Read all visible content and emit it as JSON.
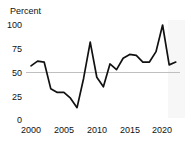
{
  "chart_data": {
    "type": "line",
    "title": "",
    "subtitle": "",
    "ylabel": "Percent",
    "xlabel": "",
    "ylim": [
      0,
      100
    ],
    "xlim": [
      1999,
      2022.5
    ],
    "yticks": [
      0,
      25,
      50,
      75,
      100
    ],
    "ytick_labels": [
      "0",
      "25",
      "50",
      "75",
      "100"
    ],
    "xticks": [
      2000,
      2005,
      2010,
      2015,
      2020
    ],
    "xtick_labels": [
      "2000",
      "2005",
      "2010",
      "2015",
      "2020"
    ],
    "grid": "horizontal-single-at-50",
    "reference_line": 50,
    "legend": "none",
    "line_color": "#111111",
    "gridline_color": "#bfbfbf",
    "background_color": "#ffffff",
    "x": [
      2000,
      2001,
      2002,
      2003,
      2004,
      2005,
      2006,
      2007,
      2008,
      2009,
      2010,
      2011,
      2012,
      2013,
      2014,
      2015,
      2016,
      2017,
      2018,
      2019,
      2020,
      2021,
      2022
    ],
    "values": [
      57,
      62,
      61,
      33,
      29,
      29,
      23,
      13,
      44,
      82,
      45,
      35,
      59,
      53,
      65,
      69,
      68,
      61,
      61,
      72,
      100,
      58,
      61
    ],
    "series": [
      {
        "name": "Percent",
        "values": [
          57,
          62,
          61,
          33,
          29,
          29,
          23,
          13,
          44,
          82,
          45,
          35,
          59,
          53,
          65,
          69,
          68,
          61,
          61,
          72,
          100,
          58,
          61
        ]
      }
    ]
  },
  "axis": {
    "y_label": "Percent",
    "y_ticks": [
      "100",
      "75",
      "50",
      "25",
      "0"
    ],
    "x_ticks": [
      "2000",
      "2005",
      "2010",
      "2015",
      "2020"
    ]
  }
}
